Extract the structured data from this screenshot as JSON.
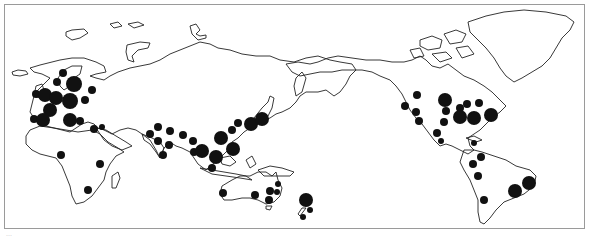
{
  "map": {
    "projection": "pacific-centered world",
    "symbol_color": "#111111",
    "outline_color": "#222222",
    "frame_color": "#9a9a9a",
    "regions": [
      "Europe",
      "Africa",
      "Asia",
      "Australia",
      "New Zealand",
      "North America",
      "South America",
      "Greenland"
    ],
    "markers": [
      {
        "region": "Europe",
        "x": 63,
        "y": 73,
        "r": 4
      },
      {
        "region": "Europe",
        "x": 57,
        "y": 82,
        "r": 4
      },
      {
        "region": "Europe",
        "x": 74,
        "y": 84,
        "r": 8
      },
      {
        "region": "Europe",
        "x": 92,
        "y": 90,
        "r": 4
      },
      {
        "region": "Europe",
        "x": 36,
        "y": 94,
        "r": 4
      },
      {
        "region": "Europe",
        "x": 45,
        "y": 95,
        "r": 7
      },
      {
        "region": "Europe",
        "x": 56,
        "y": 98,
        "r": 7
      },
      {
        "region": "Europe",
        "x": 70,
        "y": 101,
        "r": 8
      },
      {
        "region": "Europe",
        "x": 85,
        "y": 100,
        "r": 4
      },
      {
        "region": "Europe",
        "x": 50,
        "y": 110,
        "r": 7
      },
      {
        "region": "Europe",
        "x": 34,
        "y": 119,
        "r": 4
      },
      {
        "region": "Europe",
        "x": 43,
        "y": 120,
        "r": 7
      },
      {
        "region": "Europe",
        "x": 70,
        "y": 120,
        "r": 7
      },
      {
        "region": "Europe",
        "x": 80,
        "y": 121,
        "r": 4
      },
      {
        "region": "Asia",
        "x": 94,
        "y": 129,
        "r": 4
      },
      {
        "region": "Asia",
        "x": 102,
        "y": 127,
        "r": 3
      },
      {
        "region": "Asia",
        "x": 150,
        "y": 134,
        "r": 4
      },
      {
        "region": "Asia",
        "x": 158,
        "y": 127,
        "r": 4
      },
      {
        "region": "Asia",
        "x": 170,
        "y": 131,
        "r": 4
      },
      {
        "region": "Asia",
        "x": 183,
        "y": 135,
        "r": 4
      },
      {
        "region": "Asia",
        "x": 158,
        "y": 141,
        "r": 4
      },
      {
        "region": "Asia",
        "x": 169,
        "y": 145,
        "r": 4
      },
      {
        "region": "Asia",
        "x": 193,
        "y": 141,
        "r": 4
      },
      {
        "region": "Asia",
        "x": 163,
        "y": 155,
        "r": 4
      },
      {
        "region": "Asia",
        "x": 194,
        "y": 152,
        "r": 4
      },
      {
        "region": "Asia",
        "x": 202,
        "y": 151,
        "r": 7
      },
      {
        "region": "Asia",
        "x": 216,
        "y": 157,
        "r": 7
      },
      {
        "region": "Asia",
        "x": 233,
        "y": 149,
        "r": 7
      },
      {
        "region": "Asia",
        "x": 221,
        "y": 138,
        "r": 7
      },
      {
        "region": "Asia",
        "x": 232,
        "y": 130,
        "r": 4
      },
      {
        "region": "Asia",
        "x": 238,
        "y": 123,
        "r": 4
      },
      {
        "region": "Asia",
        "x": 251,
        "y": 124,
        "r": 7
      },
      {
        "region": "Asia",
        "x": 262,
        "y": 119,
        "r": 7
      },
      {
        "region": "Asia",
        "x": 212,
        "y": 168,
        "r": 4
      },
      {
        "region": "Africa",
        "x": 61,
        "y": 155,
        "r": 4
      },
      {
        "region": "Africa",
        "x": 100,
        "y": 164,
        "r": 4
      },
      {
        "region": "Africa",
        "x": 88,
        "y": 190,
        "r": 4
      },
      {
        "region": "Australia",
        "x": 223,
        "y": 193,
        "r": 4
      },
      {
        "region": "Australia",
        "x": 255,
        "y": 195,
        "r": 4
      },
      {
        "region": "Australia",
        "x": 270,
        "y": 191,
        "r": 4
      },
      {
        "region": "Australia",
        "x": 278,
        "y": 184,
        "r": 3
      },
      {
        "region": "Australia",
        "x": 277,
        "y": 192,
        "r": 3
      },
      {
        "region": "Australia",
        "x": 269,
        "y": 200,
        "r": 4
      },
      {
        "region": "New Zealand",
        "x": 306,
        "y": 200,
        "r": 7
      },
      {
        "region": "New Zealand",
        "x": 310,
        "y": 210,
        "r": 3
      },
      {
        "region": "New Zealand",
        "x": 303,
        "y": 217,
        "r": 3
      },
      {
        "region": "North America",
        "x": 417,
        "y": 95,
        "r": 4
      },
      {
        "region": "North America",
        "x": 405,
        "y": 106,
        "r": 4
      },
      {
        "region": "North America",
        "x": 416,
        "y": 112,
        "r": 4
      },
      {
        "region": "North America",
        "x": 419,
        "y": 121,
        "r": 4
      },
      {
        "region": "North America",
        "x": 445,
        "y": 100,
        "r": 7
      },
      {
        "region": "North America",
        "x": 446,
        "y": 111,
        "r": 4
      },
      {
        "region": "North America",
        "x": 444,
        "y": 122,
        "r": 4
      },
      {
        "region": "North America",
        "x": 460,
        "y": 108,
        "r": 4
      },
      {
        "region": "North America",
        "x": 467,
        "y": 104,
        "r": 4
      },
      {
        "region": "North America",
        "x": 479,
        "y": 103,
        "r": 4
      },
      {
        "region": "North America",
        "x": 491,
        "y": 115,
        "r": 7
      },
      {
        "region": "North America",
        "x": 474,
        "y": 118,
        "r": 7
      },
      {
        "region": "North America",
        "x": 460,
        "y": 117,
        "r": 7
      },
      {
        "region": "North America",
        "x": 437,
        "y": 133,
        "r": 4
      },
      {
        "region": "North America",
        "x": 441,
        "y": 141,
        "r": 3
      },
      {
        "region": "North America",
        "x": 474,
        "y": 143,
        "r": 3
      },
      {
        "region": "South America",
        "x": 481,
        "y": 157,
        "r": 4
      },
      {
        "region": "South America",
        "x": 473,
        "y": 164,
        "r": 4
      },
      {
        "region": "South America",
        "x": 478,
        "y": 176,
        "r": 4
      },
      {
        "region": "South America",
        "x": 515,
        "y": 191,
        "r": 7
      },
      {
        "region": "South America",
        "x": 529,
        "y": 183,
        "r": 7
      },
      {
        "region": "South America",
        "x": 484,
        "y": 200,
        "r": 4
      }
    ]
  },
  "caption": "..."
}
